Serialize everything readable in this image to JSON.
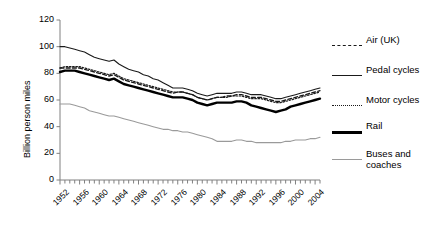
{
  "chart_data": {
    "type": "line",
    "title": "",
    "xlabel": "",
    "ylabel": "Billion person miles",
    "xlim": [
      1952,
      2005
    ],
    "ylim": [
      0,
      120
    ],
    "ytick_labels": [
      "0",
      "20",
      "40",
      "60",
      "80",
      "100",
      "120"
    ],
    "ytick_values": [
      0,
      20,
      40,
      60,
      80,
      100,
      120
    ],
    "xtick_labels": [
      "1952",
      "1956",
      "1960",
      "1964",
      "1968",
      "1972",
      "1976",
      "1980",
      "1984",
      "1988",
      "1992",
      "1996",
      "2000",
      "2004"
    ],
    "xtick_values": [
      1952,
      1956,
      1960,
      1964,
      1968,
      1972,
      1976,
      1980,
      1984,
      1988,
      1992,
      1996,
      2000,
      2004
    ],
    "grid": false,
    "legend_position": "right",
    "x": [
      1952,
      1953,
      1954,
      1955,
      1956,
      1957,
      1958,
      1959,
      1960,
      1961,
      1962,
      1963,
      1964,
      1965,
      1966,
      1967,
      1968,
      1969,
      1970,
      1971,
      1972,
      1973,
      1974,
      1975,
      1976,
      1977,
      1978,
      1979,
      1980,
      1981,
      1982,
      1983,
      1984,
      1985,
      1986,
      1987,
      1988,
      1989,
      1990,
      1991,
      1992,
      1993,
      1994,
      1995,
      1996,
      1997,
      1998,
      1999,
      2000,
      2001,
      2002,
      2003,
      2004,
      2005
    ],
    "series": [
      {
        "name": "Air (UK)",
        "style": "dashed",
        "color": "#1a1a1a",
        "width": 1.3,
        "values": [
          84,
          84,
          84,
          84,
          84,
          83,
          82,
          81,
          80,
          79,
          78,
          79,
          77,
          75,
          74,
          73,
          72,
          71,
          70,
          69,
          68,
          67,
          66,
          65,
          66,
          66,
          65,
          64,
          62,
          61,
          60,
          61,
          62,
          62,
          63,
          63,
          64,
          64,
          63,
          62,
          62,
          62,
          61,
          60,
          59,
          59,
          60,
          61,
          62,
          63,
          64,
          65,
          66,
          67
        ]
      },
      {
        "name": "Pedal  cycles",
        "style": "solid-thin",
        "color": "#1a1a1a",
        "width": 1.1,
        "values": [
          100,
          100,
          99,
          98,
          97,
          96,
          94,
          92,
          91,
          90,
          89,
          90,
          87,
          85,
          83,
          82,
          81,
          79,
          78,
          76,
          75,
          73,
          71,
          69,
          69,
          69,
          68,
          67,
          65,
          64,
          63,
          64,
          65,
          65,
          65,
          65,
          66,
          66,
          65,
          64,
          64,
          64,
          63,
          62,
          61,
          61,
          62,
          63,
          64,
          65,
          66,
          67,
          68,
          69
        ]
      },
      {
        "name": "Motor cycles",
        "style": "dotted",
        "color": "#1a1a1a",
        "width": 1.2,
        "values": [
          84,
          85,
          85,
          85,
          85,
          84,
          83,
          82,
          81,
          80,
          79,
          80,
          78,
          76,
          75,
          74,
          73,
          72,
          71,
          70,
          69,
          68,
          67,
          66,
          66,
          66,
          65,
          64,
          62,
          61,
          60,
          61,
          62,
          62,
          62,
          63,
          63,
          63,
          62,
          61,
          61,
          61,
          60,
          59,
          58,
          58,
          59,
          60,
          61,
          62,
          63,
          64,
          65,
          66
        ]
      },
      {
        "name": "Rail",
        "style": "solid-thick",
        "color": "#000000",
        "width": 2.4,
        "values": [
          81,
          82,
          82,
          82,
          81,
          80,
          79,
          78,
          77,
          76,
          75,
          76,
          74,
          72,
          71,
          70,
          69,
          68,
          67,
          66,
          65,
          64,
          63,
          62,
          62,
          62,
          61,
          60,
          58,
          57,
          56,
          57,
          58,
          58,
          58,
          58,
          59,
          59,
          58,
          56,
          55,
          54,
          53,
          52,
          51,
          52,
          53,
          55,
          56,
          57,
          58,
          59,
          60,
          61
        ]
      },
      {
        "name": "Buses and coaches",
        "style": "solid-gray",
        "color": "#9a9a9a",
        "width": 1.1,
        "values": [
          57,
          57,
          57,
          56,
          55,
          54,
          52,
          51,
          50,
          49,
          48,
          48,
          47,
          46,
          45,
          44,
          43,
          42,
          41,
          40,
          39,
          38,
          38,
          37,
          37,
          36,
          36,
          35,
          34,
          33,
          32,
          31,
          29,
          29,
          29,
          29,
          30,
          30,
          29,
          29,
          28,
          28,
          28,
          28,
          28,
          28,
          29,
          29,
          30,
          30,
          30,
          31,
          31,
          32
        ]
      }
    ],
    "legend": [
      {
        "label": "Air (UK)",
        "style": "dashed"
      },
      {
        "label": "Pedal  cycles",
        "style": "solid-thin"
      },
      {
        "label": "Motor cycles",
        "style": "dotted"
      },
      {
        "label": "Rail",
        "style": "solid-thick"
      },
      {
        "label": "Buses and",
        "label2": "coaches",
        "style": "solid-gray"
      }
    ]
  }
}
